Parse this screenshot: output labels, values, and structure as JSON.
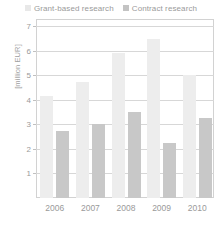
{
  "chart_data": {
    "type": "bar",
    "title": "",
    "xlabel": "",
    "ylabel": "[million EUR]",
    "categories": [
      "2006",
      "2007",
      "2008",
      "2009",
      "2010"
    ],
    "series": [
      {
        "name": "Grant-based research",
        "color": "#ededed",
        "values": [
          4.15,
          4.75,
          5.9,
          6.5,
          5.0
        ]
      },
      {
        "name": "Contract research",
        "color": "#c8c8c8",
        "values": [
          2.75,
          3.0,
          3.5,
          2.25,
          3.25
        ]
      }
    ],
    "ylim": [
      0,
      7.3
    ],
    "yticks": [
      1,
      2,
      3,
      4,
      5,
      6,
      7
    ],
    "ytick_labels": [
      "1",
      "2",
      "3",
      "4",
      "5",
      "6",
      "7"
    ],
    "grid": true,
    "legend_position": "top-center"
  },
  "legend": {
    "items": [
      {
        "label": "Grant-based research",
        "swatch": "grant"
      },
      {
        "label": "Contract research",
        "swatch": "contract"
      }
    ]
  },
  "colors": {
    "grant": "#ededed",
    "contract": "#c8c8c8",
    "grid": "#d7d7d7",
    "axis": "#d2d2d2",
    "text": "#9a9a9a"
  }
}
